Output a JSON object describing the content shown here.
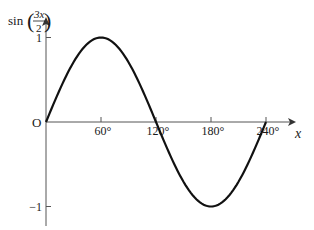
{
  "chart_data": {
    "type": "line",
    "title": "",
    "function": "sin(3x/2)",
    "ylabel": {
      "prefix": "sin",
      "numerator": "3x",
      "denominator": "2"
    },
    "xlabel": "x",
    "xlim": [
      0,
      240
    ],
    "ylim": [
      -1,
      1
    ],
    "origin_label": "O",
    "x_ticks": [
      {
        "value": 60,
        "label": "60°"
      },
      {
        "value": 120,
        "label": "120°"
      },
      {
        "value": 180,
        "label": "180°"
      },
      {
        "value": 240,
        "label": "240°"
      }
    ],
    "y_ticks": [
      {
        "value": 1,
        "label": "1"
      },
      {
        "value": -1,
        "label": "−1"
      }
    ],
    "grid": false,
    "legend": null,
    "series": [
      {
        "name": "sin(3x/2)",
        "x": [
          0,
          30,
          60,
          90,
          120,
          150,
          180,
          210,
          240
        ],
        "values": [
          0,
          0.707,
          1,
          0.707,
          0,
          -0.707,
          -1,
          -0.707,
          0
        ]
      }
    ],
    "key_points": [
      {
        "x": 0,
        "y": 0
      },
      {
        "x": 60,
        "y": 1,
        "note": "maximum"
      },
      {
        "x": 120,
        "y": 0
      },
      {
        "x": 180,
        "y": -1,
        "note": "minimum"
      },
      {
        "x": 240,
        "y": 0
      }
    ],
    "colors": {
      "axis": "#555555",
      "curve": "#111111",
      "text": "#1a1a1a"
    }
  }
}
